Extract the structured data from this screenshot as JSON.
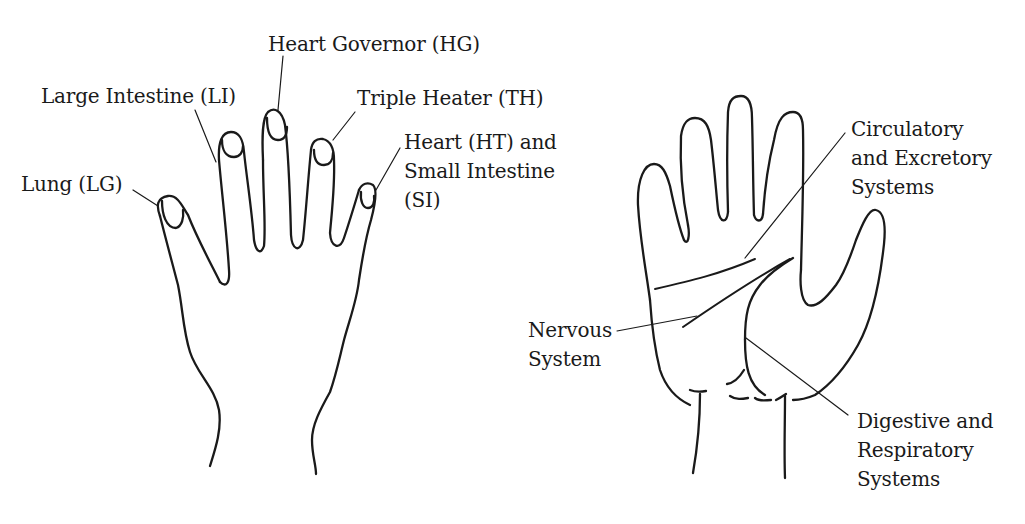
{
  "figure": {
    "left_hand": {
      "view": "back of hand",
      "labels": {
        "heart_governor": "Heart Governor (HG)",
        "large_intestine": "Large Intestine (LI)",
        "triple_heater": "Triple Heater (TH)",
        "heart_small_intestine": [
          "Heart (HT) and",
          "Small Intestine",
          "(SI)"
        ],
        "lung": "Lung (LG)"
      }
    },
    "right_hand": {
      "view": "palm",
      "labels": {
        "circulatory": [
          "Circulatory",
          "and Excretory",
          "Systems"
        ],
        "nervous": [
          "Nervous",
          "System"
        ],
        "digestive": [
          "Digestive and",
          "Respiratory",
          "Systems"
        ]
      }
    },
    "colors": {
      "ink": "#1a1a1a",
      "background": "#ffffff"
    }
  }
}
